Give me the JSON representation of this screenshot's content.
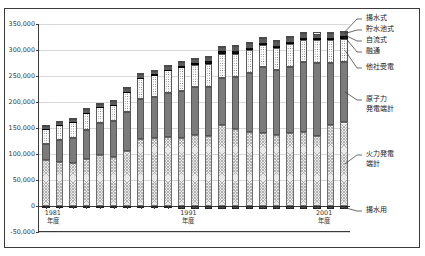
{
  "chart_data": {
    "type": "bar",
    "stacked": true,
    "title": "",
    "subtitle": "",
    "xlabel": "年度",
    "ylabel": "",
    "ylim": [
      -50000,
      350000
    ],
    "ytick_values": [
      350000,
      300000,
      250000,
      200000,
      150000,
      100000,
      50000,
      0,
      -50000
    ],
    "ytick_labels": [
      "350,000",
      "300,000",
      "250,000",
      "200,000",
      "150,000",
      "100,000",
      "50,000",
      "0",
      "-50,000"
    ],
    "grid": true,
    "legend_position": "right-callout",
    "categories": [
      "1981",
      "1982",
      "1983",
      "1984",
      "1985",
      "1986",
      "1987",
      "1988",
      "1989",
      "1990",
      "1991",
      "1992",
      "1993",
      "1994",
      "1995",
      "1996",
      "1997",
      "1998",
      "1999",
      "2000",
      "2001",
      "2002",
      "2003"
    ],
    "xtick_labels": [
      {
        "index": 0,
        "line1": "1981",
        "line2": "年度"
      },
      {
        "index": 10,
        "line1": "1991",
        "line2": "年度"
      },
      {
        "index": 20,
        "line1": "2001",
        "line2": "年度"
      }
    ],
    "series": [
      {
        "name": "火力発電端計",
        "key": "thermal",
        "pattern": "cross-hatch-light",
        "color": "#e9e9e9",
        "values": [
          88000,
          85000,
          82000,
          90000,
          98000,
          95000,
          105000,
          128000,
          130000,
          133000,
          131000,
          136000,
          135000,
          155000,
          148000,
          143000,
          140000,
          137000,
          140000,
          143000,
          135000,
          155000,
          162000
        ]
      },
      {
        "name": "原子力発電端計",
        "key": "nuclear",
        "pattern": "solid-gray",
        "color": "#7b7b7b",
        "values": [
          32000,
          42000,
          48000,
          56000,
          62000,
          68000,
          76000,
          78000,
          80000,
          84000,
          90000,
          92000,
          94000,
          92000,
          100000,
          113000,
          128000,
          125000,
          128000,
          133000,
          140000,
          120000,
          115000
        ]
      },
      {
        "name": "他社受電",
        "key": "purchase",
        "pattern": "dotted",
        "color": "#ffffff",
        "values": [
          28000,
          30000,
          32000,
          34000,
          30000,
          32000,
          38000,
          40000,
          42000,
          44000,
          46000,
          44000,
          45000,
          45000,
          45000,
          44000,
          42000,
          42000,
          44000,
          44000,
          44000,
          44000,
          45000
        ]
      },
      {
        "name": "融通",
        "key": "interchange",
        "pattern": "solid-black",
        "color": "#121212",
        "values": [
          1200,
          1300,
          1400,
          1500,
          1600,
          1800,
          2000,
          2200,
          2400,
          2600,
          3000,
          3400,
          6000,
          7000,
          6500,
          6000,
          5500,
          5200,
          5000,
          5000,
          5000,
          5200,
          5400
        ]
      },
      {
        "name": "自流式",
        "key": "run-of-river",
        "pattern": "solid-light",
        "color": "#d0d0d0",
        "values": [
          2000,
          2000,
          2100,
          2100,
          2200,
          2200,
          2300,
          2300,
          2400,
          2400,
          2500,
          2500,
          2600,
          2600,
          2600,
          2600,
          2600,
          2600,
          2600,
          2600,
          2600,
          2600,
          2600
        ]
      },
      {
        "name": "貯水池式",
        "key": "reservoir",
        "pattern": "cross-hatch-dark",
        "color": "#ffffff",
        "values": [
          2500,
          2500,
          2600,
          2600,
          2700,
          2700,
          2800,
          2800,
          2900,
          2900,
          3000,
          3000,
          3100,
          3100,
          3100,
          3100,
          3100,
          3100,
          3100,
          3100,
          3100,
          3100,
          3100
        ]
      },
      {
        "name": "揚水式",
        "key": "pumped-storage",
        "pattern": "plain-white",
        "color": "#ffffff",
        "values": [
          1500,
          1600,
          1700,
          1800,
          1900,
          2000,
          2200,
          2400,
          2600,
          2800,
          3000,
          3200,
          3400,
          3600,
          3700,
          3800,
          3900,
          4000,
          4000,
          4100,
          4100,
          4200,
          4200
        ]
      },
      {
        "name": "揚水用",
        "key": "pumping-load",
        "pattern": "solid-dark",
        "color": "#4f4f4f",
        "negative": true,
        "values": [
          -2000,
          -2200,
          -2400,
          -2600,
          -2800,
          -3200,
          -3600,
          -4000,
          -4400,
          -4800,
          -5200,
          -5400,
          -5600,
          -5800,
          -5900,
          -6000,
          -6100,
          -6200,
          -6200,
          -6300,
          -6300,
          -6400,
          -6400
        ]
      }
    ],
    "legend_callouts": [
      {
        "label": "揚水式",
        "key": "pumped-storage"
      },
      {
        "label": "貯水池式",
        "key": "reservoir"
      },
      {
        "label": "自流式",
        "key": "run-of-river"
      },
      {
        "label": "融通",
        "key": "interchange"
      },
      {
        "label": "他社受電",
        "key": "purchase"
      },
      {
        "label": "原子力",
        "key": "nuclear-1"
      },
      {
        "label": "発電端計",
        "key": "nuclear-2"
      },
      {
        "label": "火力発電",
        "key": "thermal-1"
      },
      {
        "label": "端計",
        "key": "thermal-2"
      },
      {
        "label": "揚水用",
        "key": "pumping-load"
      }
    ]
  }
}
